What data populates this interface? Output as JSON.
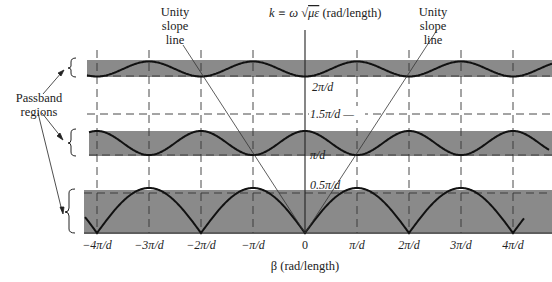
{
  "diagram": {
    "type": "dispersion-diagram",
    "y_axis_label": "k ≡ ω √με (rad/length)",
    "y_axis_label_parts": {
      "lhs": "k ≡ ω",
      "sqrt": "√",
      "radicand": "με",
      "unit": "(rad/length)"
    },
    "x_axis_label": "β (rad/length)",
    "x_ticks": [
      "−4π/d",
      "−3π/d",
      "−2π/d",
      "−π/d",
      "0",
      "π/d",
      "2π/d",
      "3π/d",
      "4π/d"
    ],
    "y_marks": [
      {
        "label": "2π/d",
        "value": 2.0
      },
      {
        "label": "1.5π/d —",
        "value": 1.5
      },
      {
        "label": "π/d",
        "value": 1.0
      },
      {
        "label": "0.5π/d",
        "value": 0.5
      }
    ],
    "annotations": {
      "unity_slope_left": [
        "Unity",
        "slope",
        "line"
      ],
      "unity_slope_right": [
        "Unity",
        "slope",
        "line"
      ],
      "passband": [
        "Passband",
        "regions"
      ]
    },
    "passbands": [
      {
        "name": "band-1",
        "k_min": 0.0,
        "k_max": 0.55
      },
      {
        "name": "band-2",
        "k_min": 1.0,
        "k_max": 1.3
      },
      {
        "name": "band-3",
        "k_min": 1.78,
        "k_max": 2.0
      }
    ],
    "colors": {
      "band_fill": "#8a8a8a",
      "curve": "#111111",
      "dashed": "#333333"
    }
  }
}
